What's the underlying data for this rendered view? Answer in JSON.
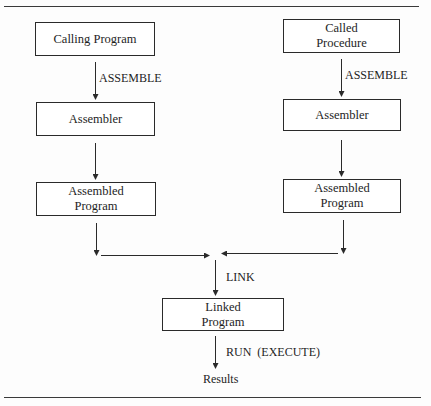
{
  "diagram": {
    "left_column": {
      "source_box": "Calling Program",
      "assemble_label": "ASSEMBLE",
      "assembler_box": "Assembler",
      "assembled_box": "Assembled\nProgram"
    },
    "right_column": {
      "source_box": "Called\nProcedure",
      "assemble_label": "ASSEMBLE",
      "assembler_box": "Assembler",
      "assembled_box": "Assembled\nProgram"
    },
    "merge": {
      "link_label": "LINK",
      "linked_box": "Linked\nProgram",
      "run_label": "RUN  (EXECUTE)",
      "result": "Results"
    },
    "colors": {
      "line": "#2a2a2a",
      "background": "#fdfdfd"
    }
  }
}
